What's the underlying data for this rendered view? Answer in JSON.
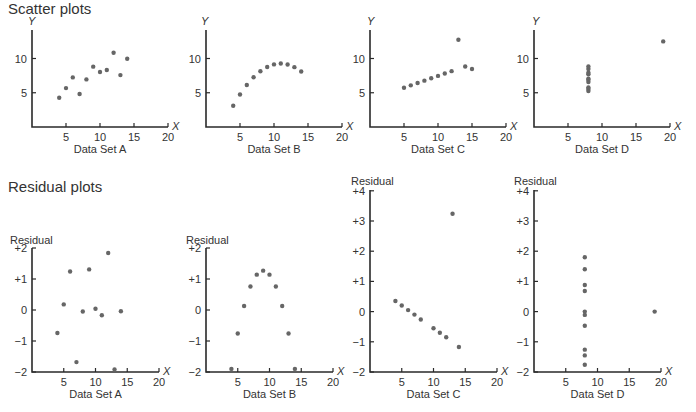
{
  "sections": {
    "scatter_title": "Scatter plots",
    "residual_title": "Residual plots"
  },
  "chart_data": [
    {
      "type": "scatter",
      "panel": "scatter",
      "title": "Data Set A",
      "xlabel": "X",
      "ylabel": "Y",
      "xlim": [
        0,
        20
      ],
      "ylim": [
        0,
        13
      ],
      "xticks": [
        "5",
        "10",
        "15",
        "20"
      ],
      "yticks": [
        "5",
        "10"
      ],
      "x": [
        4,
        5,
        6,
        7,
        8,
        9,
        10,
        11,
        12,
        13,
        14
      ],
      "y": [
        4.26,
        5.68,
        7.24,
        4.82,
        6.95,
        8.81,
        8.04,
        8.33,
        10.84,
        7.58,
        9.96
      ]
    },
    {
      "type": "scatter",
      "panel": "scatter",
      "title": "Data Set B",
      "xlabel": "X",
      "ylabel": "Y",
      "xlim": [
        0,
        20
      ],
      "ylim": [
        0,
        13
      ],
      "xticks": [
        "5",
        "10",
        "15",
        "20"
      ],
      "yticks": [
        "5",
        "10"
      ],
      "x": [
        4,
        5,
        6,
        7,
        8,
        9,
        10,
        11,
        12,
        13,
        14
      ],
      "y": [
        3.1,
        4.74,
        6.13,
        7.26,
        8.14,
        8.77,
        9.14,
        9.26,
        9.13,
        8.74,
        8.1
      ]
    },
    {
      "type": "scatter",
      "panel": "scatter",
      "title": "Data Set C",
      "xlabel": "X",
      "ylabel": "Y",
      "xlim": [
        0,
        20
      ],
      "ylim": [
        0,
        13
      ],
      "xticks": [
        "5",
        "10",
        "15",
        "20"
      ],
      "yticks": [
        "5",
        "10"
      ],
      "x": [
        5,
        6,
        7,
        8,
        9,
        10,
        11,
        12,
        13,
        14,
        15
      ],
      "y": [
        5.73,
        6.08,
        6.42,
        6.77,
        7.11,
        7.46,
        7.81,
        8.15,
        12.74,
        8.84,
        8.47
      ]
    },
    {
      "type": "scatter",
      "panel": "scatter",
      "title": "Data Set D",
      "xlabel": "X",
      "ylabel": "Y",
      "xlim": [
        0,
        20
      ],
      "ylim": [
        0,
        13
      ],
      "xticks": [
        "5",
        "10",
        "15",
        "20"
      ],
      "yticks": [
        "5",
        "10"
      ],
      "x": [
        8,
        8,
        8,
        8,
        8,
        8,
        8,
        8,
        8,
        8,
        19
      ],
      "y": [
        5.25,
        5.56,
        5.76,
        6.58,
        6.89,
        7.04,
        7.71,
        7.91,
        8.47,
        8.84,
        12.5
      ]
    },
    {
      "type": "scatter",
      "panel": "residual",
      "title": "Data Set A",
      "xlabel": "X",
      "ylabel": "Residual",
      "xlim": [
        0,
        20
      ],
      "ylim": [
        -2,
        2
      ],
      "xticks": [
        "5",
        "10",
        "15",
        "20"
      ],
      "yticks": [
        "+2",
        "+1",
        "0",
        "−1",
        "−2"
      ],
      "x": [
        4,
        5,
        6,
        7,
        8,
        9,
        10,
        11,
        12,
        13,
        14
      ],
      "y": [
        -0.74,
        0.18,
        1.24,
        -1.68,
        -0.05,
        1.31,
        0.04,
        -0.17,
        1.84,
        -1.92,
        -0.04
      ]
    },
    {
      "type": "scatter",
      "panel": "residual",
      "title": "Data Set B",
      "xlabel": "X",
      "ylabel": "Residual",
      "xlim": [
        0,
        20
      ],
      "ylim": [
        -2,
        2
      ],
      "xticks": [
        "5",
        "10",
        "15",
        "20"
      ],
      "yticks": [
        "+2",
        "+1",
        "0",
        "−1",
        "−2"
      ],
      "x": [
        4,
        5,
        6,
        7,
        8,
        9,
        10,
        11,
        12,
        13,
        14
      ],
      "y": [
        -1.9,
        -0.76,
        0.13,
        0.76,
        1.14,
        1.27,
        1.14,
        0.76,
        0.13,
        -0.76,
        -1.9
      ]
    },
    {
      "type": "scatter",
      "panel": "residual",
      "title": "Data Set C",
      "xlabel": "X",
      "ylabel": "Residual",
      "xlim": [
        0,
        20
      ],
      "ylim": [
        -2,
        4
      ],
      "xticks": [
        "5",
        "10",
        "15",
        "20"
      ],
      "yticks": [
        "+4",
        "+3",
        "+2",
        "+1",
        "0",
        "−1",
        "−2"
      ],
      "x": [
        4,
        5,
        6,
        7,
        8,
        10,
        11,
        12,
        13,
        14
      ],
      "y": [
        0.35,
        0.2,
        0.05,
        -0.1,
        -0.26,
        -0.55,
        -0.7,
        -0.85,
        3.24,
        -1.17
      ]
    },
    {
      "type": "scatter",
      "panel": "residual",
      "title": "Data Set D",
      "xlabel": "X",
      "ylabel": "Residual",
      "xlim": [
        0,
        20
      ],
      "ylim": [
        -2,
        4
      ],
      "xticks": [
        "5",
        "10",
        "15",
        "20"
      ],
      "yticks": [
        "+4",
        "+3",
        "+2",
        "+1",
        "0",
        "−1",
        "−2"
      ],
      "x": [
        8,
        8,
        8,
        8,
        8,
        8,
        8,
        8,
        8,
        8,
        19
      ],
      "y": [
        1.8,
        1.4,
        0.88,
        0.68,
        0.0,
        -0.11,
        -0.47,
        -1.26,
        -1.45,
        -1.76,
        0.0
      ]
    }
  ]
}
